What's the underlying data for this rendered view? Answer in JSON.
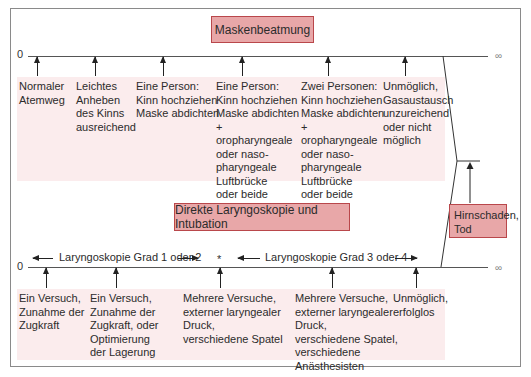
{
  "mask_ventilation": {
    "title": "Maskenbeatmung",
    "axis_start": "0",
    "axis_end": "∞",
    "items": [
      {
        "text": "Normaler\nAtemweg"
      },
      {
        "text": "Leichtes\nAnheben\ndes Kinns\nausreichend"
      },
      {
        "text": "Eine Person:\nKinn hochziehen\nMaske abdichten"
      },
      {
        "text": "Eine Person:\nKinn hochziehen\nMaske abdichten\n+\noropharyngeale\noder naso-\npharyngeale\nLuftbrücke\noder beide"
      },
      {
        "text": "Zwei Personen:\nKinn hochziehen\nMaske abdichten\n+\noropharyngeale\noder naso-\npharyngeale\nLuftbrücke\noder beide"
      },
      {
        "text": "Unmöglich,\nGasaustausch\nunzureichend\noder nicht\nmöglich"
      }
    ]
  },
  "laryngoscopy": {
    "title": "Direkte Laryngoskopie und Intubation",
    "axis_start": "0",
    "axis_end": "∞",
    "range_left": "Laryngoskopie Grad 1 oder 2",
    "range_mid": "*",
    "range_right": "Laryngoskopie Grad 3 oder 4",
    "items": [
      {
        "text": "Ein Versuch,\nZunahme der\nZugkraft"
      },
      {
        "text": "Ein Versuch,\nZunahme der\nZugkraft, oder\nOptimierung\nder Lagerung"
      },
      {
        "text": "Mehrere Versuche,\nexterner laryngealer\nDruck,\nverschiedene Spatel"
      },
      {
        "text": "Mehrere Versuche,\nexterner laryngealer\nDruck,\nverschiedene Spatel,\nverschiedene\nAnästhesisten"
      },
      {
        "text": "Unmöglich,\nerfolglos"
      }
    ]
  },
  "outcome": {
    "text": "Hirnschaden,\nTod"
  },
  "colors": {
    "title_fill": "#e8a7a8",
    "title_border": "#b9474b",
    "band_fill": "#fbeced"
  }
}
